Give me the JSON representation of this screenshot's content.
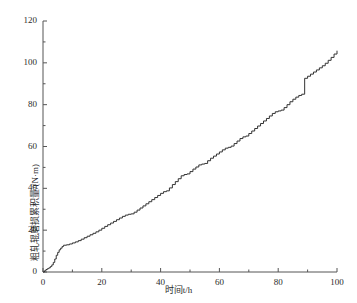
{
  "chart_data": {
    "type": "line",
    "line_style": "step-post",
    "title": "",
    "xlabel": "时间t/h",
    "ylabel": "粗轧辊磨损累积量/(N·m)",
    "xlim": [
      0,
      100
    ],
    "ylim": [
      0,
      120
    ],
    "xticks": [
      0,
      20,
      40,
      60,
      80,
      100
    ],
    "xtick_labels": [
      "0",
      "20",
      "40",
      "60",
      "80",
      "100"
    ],
    "xminor_step": 10,
    "yticks": [
      0,
      20,
      40,
      60,
      80,
      100,
      120
    ],
    "ytick_labels": [
      "0",
      "20",
      "40",
      "60",
      "80",
      "100",
      "120"
    ],
    "yminor_step": 10,
    "grid": false,
    "legend": null,
    "series_color": "#333333",
    "axis_color": "#555555",
    "series": [
      {
        "name": "累积磨损量",
        "x": [
          0,
          0.5,
          1.0,
          1.5,
          2.0,
          2.5,
          3.0,
          3.5,
          4.0,
          4.5,
          5.0,
          5.5,
          6.0,
          6.5,
          7.0,
          8.0,
          9.0,
          10.0,
          11.0,
          12.0,
          13.0,
          14.0,
          15.0,
          16.0,
          17.0,
          18.0,
          19.0,
          20.0,
          21.0,
          22.0,
          23.0,
          24.0,
          25.0,
          26.0,
          27.0,
          28.0,
          29.0,
          30.0,
          31.0,
          32.0,
          33.0,
          34.0,
          35.0,
          36.0,
          37.0,
          38.0,
          39.0,
          40.0,
          41.0,
          42.0,
          43.0,
          44.0,
          45.0,
          46.0,
          47.0,
          48.0,
          49.0,
          50.0,
          51.0,
          52.0,
          53.0,
          54.0,
          55.0,
          56.0,
          57.0,
          58.0,
          59.0,
          60.0,
          61.0,
          62.0,
          63.0,
          64.0,
          65.0,
          66.0,
          67.0,
          68.0,
          69.0,
          70.0,
          71.0,
          72.0,
          73.0,
          74.0,
          75.0,
          76.0,
          77.0,
          78.0,
          79.0,
          80.0,
          81.0,
          82.0,
          83.0,
          84.0,
          85.0,
          86.0,
          87.0,
          88.0,
          89.0,
          90.0,
          91.0,
          92.0,
          93.0,
          94.0,
          95.0,
          96.0,
          97.0,
          98.0,
          99.0,
          100.0
        ],
        "y": [
          0.0,
          0.6,
          1.2,
          1.6,
          2.0,
          2.6,
          3.4,
          4.6,
          6.2,
          8.0,
          9.4,
          10.6,
          11.4,
          12.2,
          12.8,
          13.0,
          13.4,
          13.9,
          14.4,
          15.0,
          15.7,
          16.4,
          17.1,
          17.8,
          18.5,
          19.2,
          20.0,
          20.9,
          21.8,
          22.6,
          23.4,
          24.2,
          25.0,
          25.8,
          26.6,
          27.2,
          27.6,
          27.8,
          28.6,
          29.6,
          30.6,
          31.6,
          32.6,
          33.6,
          34.6,
          35.6,
          36.6,
          37.6,
          38.4,
          38.8,
          40.2,
          41.8,
          43.2,
          44.6,
          46.0,
          46.6,
          46.9,
          48.0,
          49.2,
          50.2,
          51.2,
          51.6,
          51.9,
          53.2,
          54.4,
          55.4,
          56.4,
          57.4,
          58.4,
          59.2,
          59.6,
          60.2,
          61.4,
          62.6,
          63.8,
          64.6,
          65.0,
          66.2,
          67.4,
          68.6,
          69.8,
          71.0,
          72.2,
          73.4,
          74.6,
          75.8,
          76.6,
          77.0,
          77.4,
          78.6,
          80.0,
          81.4,
          82.6,
          83.6,
          84.4,
          85.0,
          92.6,
          93.6,
          94.6,
          95.6,
          96.6,
          97.6,
          98.6,
          99.8,
          101.2,
          102.6,
          104.2,
          105.8
        ]
      }
    ]
  }
}
